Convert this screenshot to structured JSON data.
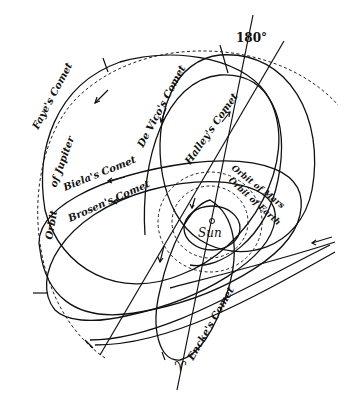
{
  "diagram": {
    "center_label": "Sun",
    "direction_label": "180°",
    "equinox_symbol": "♈",
    "labels": {
      "faye": "Faye's Comet",
      "devico": "De Vico's Comet",
      "halley": "Halley's Comet",
      "biela": "Biela's Comet",
      "brosen": "Brosen's Comet",
      "encke": "Encke's Comet",
      "orbit_jupiter_1": "Orbit",
      "orbit_jupiter_2": "of Jupiter",
      "orbit_mars": "Orbit of Mars",
      "orbit_earth": "Orbit of Earth"
    },
    "colors": {
      "ink": "#111111",
      "background": "#ffffff"
    }
  }
}
